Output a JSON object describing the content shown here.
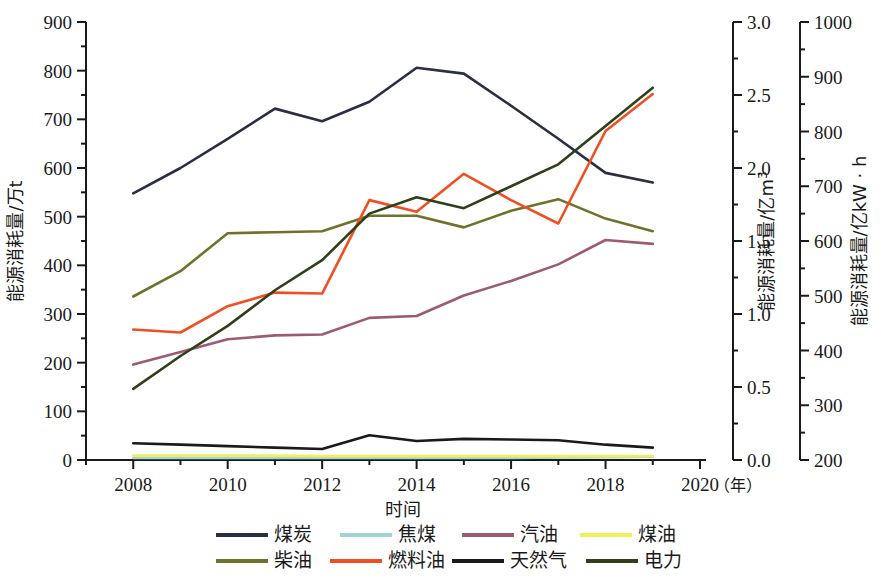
{
  "chart_data": {
    "type": "line",
    "title": "",
    "xlabel": "时间",
    "xlabel_unit": "（年）",
    "x": [
      2008,
      2009,
      2010,
      2011,
      2012,
      2013,
      2014,
      2015,
      2016,
      2017,
      2018,
      2019
    ],
    "xlim": [
      2007,
      2020
    ],
    "xticks": [
      2008,
      2010,
      2012,
      2014,
      2016,
      2018,
      2020
    ],
    "xtick_labels": [
      "2008",
      "2010",
      "2012",
      "2014",
      "2016",
      "2018",
      "2020"
    ],
    "grid": false,
    "legend_position": "bottom",
    "axes": [
      {
        "id": "left",
        "label": "能源消耗量/万t",
        "ylim": [
          0,
          900
        ],
        "yticks": [
          0,
          100,
          200,
          300,
          400,
          500,
          600,
          700,
          800,
          900
        ],
        "ytick_labels": [
          "0",
          "100",
          "200",
          "300",
          "400",
          "500",
          "600",
          "700",
          "800",
          "900"
        ],
        "minor_ticks": true
      },
      {
        "id": "right1",
        "label": "能源消耗量/亿m³",
        "ylim": [
          0.0,
          3.0
        ],
        "yticks": [
          0.0,
          0.5,
          1.0,
          1.5,
          2.0,
          2.5,
          3.0
        ],
        "ytick_labels": [
          "0.0",
          "0.5",
          "1.0",
          "1.5",
          "2.0",
          "2.5",
          "3.0"
        ],
        "minor_ticks": true
      },
      {
        "id": "right2",
        "label": "能源消耗量/亿kW · h",
        "ylim": [
          200,
          1000
        ],
        "yticks": [
          200,
          300,
          400,
          500,
          600,
          700,
          800,
          900,
          1000
        ],
        "ytick_labels": [
          "200",
          "300",
          "400",
          "500",
          "600",
          "700",
          "800",
          "900",
          "1000"
        ],
        "minor_ticks": true
      }
    ],
    "series": [
      {
        "name": "煤炭",
        "axis": "left",
        "color": "#2b2d45",
        "values": [
          548,
          600,
          660,
          722,
          696,
          736,
          806,
          794,
          728,
          660,
          590,
          570
        ]
      },
      {
        "name": "焦煤",
        "axis": "left",
        "color": "#9fd4d8",
        "values": [
          4,
          4,
          4,
          4,
          4,
          4,
          4,
          4,
          4,
          5,
          6,
          7
        ]
      },
      {
        "name": "汽油",
        "axis": "left",
        "color": "#9c5a74",
        "values": [
          196,
          222,
          248,
          256,
          258,
          292,
          296,
          338,
          368,
          402,
          452,
          444
        ]
      },
      {
        "name": "煤油",
        "axis": "left",
        "color": "#f2f05a",
        "values": [
          9,
          9,
          9,
          9,
          8,
          8,
          8,
          8,
          8,
          8,
          8,
          8
        ]
      },
      {
        "name": "柴油",
        "axis": "left",
        "color": "#72712b",
        "values": [
          336,
          388,
          466,
          468,
          470,
          502,
          502,
          478,
          512,
          536,
          496,
          470
        ]
      },
      {
        "name": "燃料油",
        "axis": "left",
        "color": "#f04e23",
        "values": [
          268,
          262,
          316,
          344,
          342,
          534,
          510,
          588,
          534,
          486,
          676,
          752
        ]
      },
      {
        "name": "天然气",
        "axis": "right1",
        "color": "#1a1a1a",
        "values": [
          0.115,
          0.105,
          0.095,
          0.085,
          0.075,
          0.17,
          0.13,
          0.145,
          0.14,
          0.135,
          0.105,
          0.085
        ]
      },
      {
        "name": "电力",
        "axis": "right2",
        "color": "#2d4018",
        "values": [
          330,
          390,
          445,
          510,
          565,
          650,
          680,
          660,
          700,
          740,
          810,
          880
        ]
      }
    ]
  },
  "legend": {
    "row1": [
      {
        "label": "煤炭",
        "color": "#2b2d45"
      },
      {
        "label": "焦煤",
        "color": "#9fd4d8"
      },
      {
        "label": "汽油",
        "color": "#9c5a74"
      },
      {
        "label": "煤油",
        "color": "#f2f05a"
      }
    ],
    "row2": [
      {
        "label": "柴油",
        "color": "#72712b"
      },
      {
        "label": "燃料油",
        "color": "#f04e23"
      },
      {
        "label": "天然气",
        "color": "#1a1a1a"
      },
      {
        "label": "电力",
        "color": "#2d4018"
      }
    ]
  },
  "axis_titles": {
    "left": "能源消耗量/万t",
    "right1_a": "能源消耗量/亿m",
    "right1_sup": "3",
    "right2": "能源消耗量/亿kW · h",
    "x": "时间",
    "x_unit": "（年）"
  }
}
